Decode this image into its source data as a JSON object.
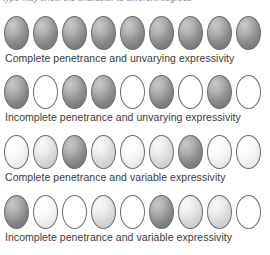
{
  "figure": {
    "top_caption": "type may show the character to different degrees",
    "oval_count_per_row": 9,
    "colors": {
      "outline": "#6f6f6f",
      "dark_gray": "#9a9a9a",
      "mid_gray": "#b4b4b4",
      "light_gray": "#e4e4e4",
      "very_light_gray": "#f6f6f6",
      "white": "#ffffff",
      "text": "#3b3b3b",
      "background": "#ffffff"
    },
    "rows": [
      {
        "label": "Complete penetrance and unvarying expressivity",
        "shades": [
          "dark",
          "dark",
          "dark",
          "dark",
          "dark",
          "dark",
          "dark",
          "dark",
          "dark"
        ]
      },
      {
        "label": "Incomplete penetrance and unvarying expressivity",
        "shades": [
          "dark",
          "white",
          "dark",
          "dark",
          "white",
          "dark",
          "white",
          "dark",
          "white"
        ]
      },
      {
        "label": "Complete penetrance and variable expressivity",
        "shades": [
          "vlight",
          "light",
          "dark",
          "light",
          "vlight",
          "light",
          "dark",
          "vlight",
          "vlight"
        ]
      },
      {
        "label": "Incomplete penetrance and variable expressivity",
        "shades": [
          "dark",
          "vlight",
          "white",
          "light",
          "white",
          "dark",
          "light",
          "light",
          "white"
        ]
      }
    ]
  }
}
